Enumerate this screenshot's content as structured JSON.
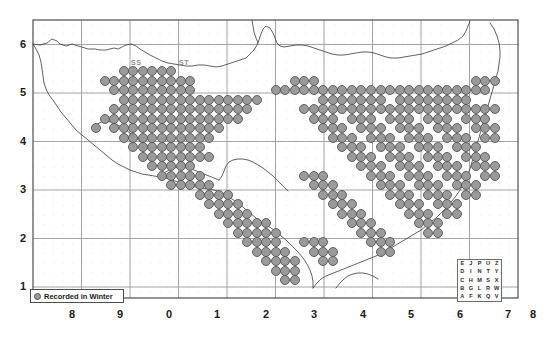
{
  "figure": {
    "type": "distribution-map",
    "region": "South West England (OS 100km grid squares)",
    "background_color": "#ffffff",
    "frame_color": "#4d4d4d"
  },
  "axes": {
    "x_labels": [
      "8",
      "9",
      "0",
      "1",
      "2",
      "3",
      "4",
      "5",
      "6",
      "7",
      "8"
    ],
    "y_labels": [
      "6",
      "5",
      "4",
      "3",
      "2",
      "1"
    ],
    "grid_color": "#999999",
    "minor_dot_color": "#d9d4d4"
  },
  "square_labels": [
    {
      "text": "SS",
      "x": 131,
      "y": 59
    },
    {
      "text": "ST",
      "x": 179,
      "y": 59
    }
  ],
  "legend": {
    "symbol": "filled-circle",
    "symbol_color": "#9a9a9a",
    "label": "Recorded in Winter"
  },
  "grid_key": {
    "title": "os-grid-letters",
    "rows": [
      [
        "E",
        "J",
        "P",
        "U",
        "Z"
      ],
      [
        "D",
        "I",
        "N",
        "T",
        "Y"
      ],
      [
        "C",
        "H",
        "M",
        "S",
        "X"
      ],
      [
        "B",
        "G",
        "L",
        "R",
        "W"
      ],
      [
        "A",
        "F",
        "K",
        "Q",
        "V"
      ]
    ]
  },
  "chart_data": {
    "type": "scatter",
    "title": "",
    "xlabel": "",
    "ylabel": "",
    "marker": {
      "shape": "circle",
      "fill": "#9a9a9a",
      "stroke": "#555555",
      "size_px": 9
    },
    "grid": true,
    "xlim": [
      0,
      11
    ],
    "ylim": [
      0,
      6.8
    ],
    "note": "Each marker = one 10km square record; coordinates are pixel positions on the 10km lattice.",
    "points": [
      [
        124,
        71
      ],
      [
        133,
        71
      ],
      [
        143,
        71
      ],
      [
        152,
        71
      ],
      [
        162,
        71
      ],
      [
        171,
        71
      ],
      [
        105,
        81
      ],
      [
        114,
        81
      ],
      [
        124,
        81
      ],
      [
        133,
        81
      ],
      [
        143,
        81
      ],
      [
        152,
        81
      ],
      [
        162,
        81
      ],
      [
        171,
        81
      ],
      [
        181,
        81
      ],
      [
        190,
        81
      ],
      [
        114,
        90
      ],
      [
        124,
        90
      ],
      [
        133,
        90
      ],
      [
        143,
        90
      ],
      [
        152,
        90
      ],
      [
        162,
        90
      ],
      [
        171,
        90
      ],
      [
        181,
        90
      ],
      [
        190,
        90
      ],
      [
        124,
        100
      ],
      [
        133,
        100
      ],
      [
        143,
        100
      ],
      [
        152,
        100
      ],
      [
        162,
        100
      ],
      [
        171,
        100
      ],
      [
        181,
        100
      ],
      [
        190,
        100
      ],
      [
        200,
        100
      ],
      [
        209,
        100
      ],
      [
        219,
        100
      ],
      [
        228,
        100
      ],
      [
        238,
        100
      ],
      [
        247,
        100
      ],
      [
        257,
        100
      ],
      [
        114,
        109
      ],
      [
        124,
        109
      ],
      [
        133,
        109
      ],
      [
        143,
        109
      ],
      [
        152,
        109
      ],
      [
        162,
        109
      ],
      [
        171,
        109
      ],
      [
        181,
        109
      ],
      [
        190,
        109
      ],
      [
        200,
        109
      ],
      [
        209,
        109
      ],
      [
        219,
        109
      ],
      [
        228,
        109
      ],
      [
        238,
        109
      ],
      [
        247,
        109
      ],
      [
        105,
        119
      ],
      [
        114,
        119
      ],
      [
        124,
        119
      ],
      [
        133,
        119
      ],
      [
        143,
        119
      ],
      [
        152,
        119
      ],
      [
        162,
        119
      ],
      [
        171,
        119
      ],
      [
        181,
        119
      ],
      [
        190,
        119
      ],
      [
        200,
        119
      ],
      [
        209,
        119
      ],
      [
        219,
        119
      ],
      [
        228,
        119
      ],
      [
        238,
        119
      ],
      [
        96,
        128
      ],
      [
        114,
        128
      ],
      [
        124,
        128
      ],
      [
        133,
        128
      ],
      [
        143,
        128
      ],
      [
        152,
        128
      ],
      [
        162,
        128
      ],
      [
        171,
        128
      ],
      [
        181,
        128
      ],
      [
        190,
        128
      ],
      [
        200,
        128
      ],
      [
        209,
        128
      ],
      [
        219,
        128
      ],
      [
        124,
        138
      ],
      [
        133,
        138
      ],
      [
        143,
        138
      ],
      [
        152,
        138
      ],
      [
        162,
        138
      ],
      [
        171,
        138
      ],
      [
        181,
        138
      ],
      [
        190,
        138
      ],
      [
        200,
        138
      ],
      [
        209,
        138
      ],
      [
        133,
        147
      ],
      [
        143,
        147
      ],
      [
        152,
        147
      ],
      [
        162,
        147
      ],
      [
        171,
        147
      ],
      [
        181,
        147
      ],
      [
        190,
        147
      ],
      [
        200,
        147
      ],
      [
        143,
        157
      ],
      [
        152,
        157
      ],
      [
        162,
        157
      ],
      [
        171,
        157
      ],
      [
        181,
        157
      ],
      [
        190,
        157
      ],
      [
        200,
        157
      ],
      [
        209,
        157
      ],
      [
        152,
        166
      ],
      [
        162,
        166
      ],
      [
        171,
        166
      ],
      [
        181,
        166
      ],
      [
        190,
        166
      ],
      [
        162,
        176
      ],
      [
        171,
        176
      ],
      [
        181,
        176
      ],
      [
        190,
        176
      ],
      [
        200,
        176
      ],
      [
        171,
        185
      ],
      [
        181,
        185
      ],
      [
        190,
        185
      ],
      [
        200,
        185
      ],
      [
        209,
        185
      ],
      [
        200,
        195
      ],
      [
        209,
        195
      ],
      [
        219,
        195
      ],
      [
        228,
        195
      ],
      [
        209,
        204
      ],
      [
        219,
        204
      ],
      [
        228,
        204
      ],
      [
        238,
        204
      ],
      [
        219,
        214
      ],
      [
        228,
        214
      ],
      [
        238,
        214
      ],
      [
        247,
        214
      ],
      [
        228,
        223
      ],
      [
        238,
        223
      ],
      [
        247,
        223
      ],
      [
        257,
        223
      ],
      [
        266,
        223
      ],
      [
        238,
        233
      ],
      [
        247,
        233
      ],
      [
        257,
        233
      ],
      [
        266,
        233
      ],
      [
        276,
        233
      ],
      [
        247,
        242
      ],
      [
        257,
        242
      ],
      [
        266,
        242
      ],
      [
        276,
        242
      ],
      [
        257,
        252
      ],
      [
        266,
        252
      ],
      [
        276,
        252
      ],
      [
        285,
        252
      ],
      [
        266,
        261
      ],
      [
        276,
        261
      ],
      [
        285,
        261
      ],
      [
        295,
        261
      ],
      [
        276,
        271
      ],
      [
        285,
        271
      ],
      [
        295,
        271
      ],
      [
        285,
        280
      ],
      [
        295,
        280
      ],
      [
        276,
        90
      ],
      [
        285,
        90
      ],
      [
        295,
        90
      ],
      [
        304,
        90
      ],
      [
        295,
        81
      ],
      [
        304,
        81
      ],
      [
        314,
        81
      ],
      [
        314,
        90
      ],
      [
        323,
        90
      ],
      [
        333,
        90
      ],
      [
        323,
        100
      ],
      [
        333,
        100
      ],
      [
        342,
        100
      ],
      [
        352,
        100
      ],
      [
        342,
        90
      ],
      [
        352,
        90
      ],
      [
        361,
        90
      ],
      [
        371,
        90
      ],
      [
        361,
        100
      ],
      [
        371,
        100
      ],
      [
        381,
        100
      ],
      [
        381,
        90
      ],
      [
        390,
        90
      ],
      [
        400,
        90
      ],
      [
        409,
        90
      ],
      [
        400,
        100
      ],
      [
        409,
        100
      ],
      [
        419,
        100
      ],
      [
        428,
        100
      ],
      [
        419,
        90
      ],
      [
        428,
        90
      ],
      [
        438,
        90
      ],
      [
        447,
        90
      ],
      [
        438,
        100
      ],
      [
        447,
        100
      ],
      [
        457,
        100
      ],
      [
        466,
        100
      ],
      [
        457,
        90
      ],
      [
        466,
        90
      ],
      [
        476,
        90
      ],
      [
        485,
        90
      ],
      [
        476,
        81
      ],
      [
        485,
        81
      ],
      [
        495,
        81
      ],
      [
        304,
        109
      ],
      [
        314,
        109
      ],
      [
        323,
        109
      ],
      [
        333,
        109
      ],
      [
        342,
        109
      ],
      [
        352,
        109
      ],
      [
        361,
        109
      ],
      [
        371,
        109
      ],
      [
        381,
        109
      ],
      [
        390,
        109
      ],
      [
        400,
        109
      ],
      [
        409,
        109
      ],
      [
        419,
        109
      ],
      [
        428,
        109
      ],
      [
        438,
        109
      ],
      [
        447,
        109
      ],
      [
        457,
        109
      ],
      [
        466,
        109
      ],
      [
        476,
        109
      ],
      [
        485,
        109
      ],
      [
        495,
        109
      ],
      [
        314,
        119
      ],
      [
        323,
        119
      ],
      [
        333,
        119
      ],
      [
        352,
        119
      ],
      [
        361,
        119
      ],
      [
        371,
        119
      ],
      [
        390,
        119
      ],
      [
        400,
        119
      ],
      [
        409,
        119
      ],
      [
        428,
        119
      ],
      [
        438,
        119
      ],
      [
        447,
        119
      ],
      [
        466,
        119
      ],
      [
        476,
        119
      ],
      [
        485,
        119
      ],
      [
        323,
        128
      ],
      [
        333,
        128
      ],
      [
        342,
        128
      ],
      [
        361,
        128
      ],
      [
        371,
        128
      ],
      [
        381,
        128
      ],
      [
        400,
        128
      ],
      [
        409,
        128
      ],
      [
        419,
        128
      ],
      [
        438,
        128
      ],
      [
        447,
        128
      ],
      [
        457,
        128
      ],
      [
        476,
        128
      ],
      [
        485,
        128
      ],
      [
        495,
        128
      ],
      [
        333,
        138
      ],
      [
        342,
        138
      ],
      [
        352,
        138
      ],
      [
        371,
        138
      ],
      [
        381,
        138
      ],
      [
        390,
        138
      ],
      [
        409,
        138
      ],
      [
        419,
        138
      ],
      [
        428,
        138
      ],
      [
        447,
        138
      ],
      [
        457,
        138
      ],
      [
        466,
        138
      ],
      [
        485,
        138
      ],
      [
        495,
        138
      ],
      [
        342,
        147
      ],
      [
        352,
        147
      ],
      [
        361,
        147
      ],
      [
        381,
        147
      ],
      [
        390,
        147
      ],
      [
        400,
        147
      ],
      [
        419,
        147
      ],
      [
        428,
        147
      ],
      [
        438,
        147
      ],
      [
        457,
        147
      ],
      [
        466,
        147
      ],
      [
        476,
        147
      ],
      [
        352,
        157
      ],
      [
        361,
        157
      ],
      [
        371,
        157
      ],
      [
        390,
        157
      ],
      [
        400,
        157
      ],
      [
        409,
        157
      ],
      [
        428,
        157
      ],
      [
        438,
        157
      ],
      [
        447,
        157
      ],
      [
        466,
        157
      ],
      [
        476,
        157
      ],
      [
        485,
        157
      ],
      [
        361,
        166
      ],
      [
        371,
        166
      ],
      [
        381,
        166
      ],
      [
        400,
        166
      ],
      [
        409,
        166
      ],
      [
        419,
        166
      ],
      [
        438,
        166
      ],
      [
        447,
        166
      ],
      [
        457,
        166
      ],
      [
        476,
        166
      ],
      [
        485,
        166
      ],
      [
        495,
        166
      ],
      [
        304,
        176
      ],
      [
        314,
        176
      ],
      [
        323,
        176
      ],
      [
        371,
        176
      ],
      [
        381,
        176
      ],
      [
        390,
        176
      ],
      [
        409,
        176
      ],
      [
        419,
        176
      ],
      [
        428,
        176
      ],
      [
        447,
        176
      ],
      [
        457,
        176
      ],
      [
        466,
        176
      ],
      [
        485,
        176
      ],
      [
        495,
        176
      ],
      [
        314,
        185
      ],
      [
        323,
        185
      ],
      [
        333,
        185
      ],
      [
        381,
        185
      ],
      [
        390,
        185
      ],
      [
        400,
        185
      ],
      [
        419,
        185
      ],
      [
        428,
        185
      ],
      [
        438,
        185
      ],
      [
        457,
        185
      ],
      [
        466,
        185
      ],
      [
        476,
        185
      ],
      [
        323,
        195
      ],
      [
        333,
        195
      ],
      [
        342,
        195
      ],
      [
        390,
        195
      ],
      [
        400,
        195
      ],
      [
        409,
        195
      ],
      [
        428,
        195
      ],
      [
        438,
        195
      ],
      [
        447,
        195
      ],
      [
        466,
        195
      ],
      [
        476,
        195
      ],
      [
        333,
        204
      ],
      [
        342,
        204
      ],
      [
        352,
        204
      ],
      [
        400,
        204
      ],
      [
        409,
        204
      ],
      [
        419,
        204
      ],
      [
        438,
        204
      ],
      [
        447,
        204
      ],
      [
        457,
        204
      ],
      [
        342,
        214
      ],
      [
        352,
        214
      ],
      [
        361,
        214
      ],
      [
        409,
        214
      ],
      [
        419,
        214
      ],
      [
        428,
        214
      ],
      [
        447,
        214
      ],
      [
        457,
        214
      ],
      [
        352,
        223
      ],
      [
        361,
        223
      ],
      [
        371,
        223
      ],
      [
        419,
        223
      ],
      [
        428,
        223
      ],
      [
        438,
        223
      ],
      [
        361,
        233
      ],
      [
        371,
        233
      ],
      [
        381,
        233
      ],
      [
        428,
        233
      ],
      [
        438,
        233
      ],
      [
        304,
        242
      ],
      [
        314,
        242
      ],
      [
        323,
        242
      ],
      [
        371,
        242
      ],
      [
        381,
        242
      ],
      [
        390,
        242
      ],
      [
        314,
        252
      ],
      [
        323,
        252
      ],
      [
        333,
        252
      ],
      [
        381,
        252
      ],
      [
        390,
        252
      ],
      [
        323,
        261
      ],
      [
        333,
        261
      ]
    ]
  }
}
